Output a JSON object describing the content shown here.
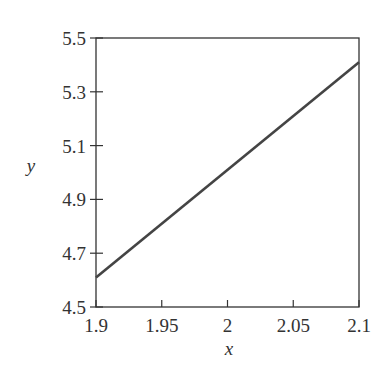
{
  "chart_data": {
    "type": "line",
    "title": "",
    "xlabel": "x",
    "ylabel": "y",
    "xlim": [
      1.9,
      2.1
    ],
    "ylim": [
      4.5,
      5.5
    ],
    "grid": false,
    "legend": null,
    "xticks": [
      1.9,
      1.95,
      2,
      2.05,
      2.1
    ],
    "xtick_labels": [
      "1.9",
      "1.95",
      "2",
      "2.05",
      "2.1"
    ],
    "yticks": [
      4.5,
      4.7,
      4.9,
      5.1,
      5.3,
      5.5
    ],
    "ytick_labels": [
      "4.5",
      "4.7",
      "4.9",
      "5.1",
      "5.3",
      "5.5"
    ],
    "series": [
      {
        "name": "y",
        "x": [
          1.9,
          2.1
        ],
        "y": [
          4.61,
          5.41
        ],
        "color": "#444444"
      }
    ]
  },
  "style": {
    "line_color": "#444444",
    "axis_color": "#333333"
  }
}
